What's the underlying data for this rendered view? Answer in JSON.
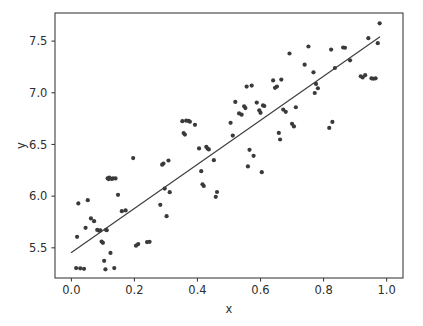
{
  "figure": {
    "width": 423,
    "height": 326,
    "background": "#ffffff"
  },
  "style": {
    "point_color": "#3a3a3a",
    "point_radius": 2.1,
    "line_color": "#3f3f3f",
    "line_width": 1.2,
    "axis_color": "#3f3f3f",
    "text_color": "#2e2e2e"
  },
  "axes_geometry": {
    "left_px": 55,
    "top_px": 13,
    "right_px": 403,
    "bottom_px": 278
  },
  "chart_data": {
    "type": "scatter",
    "title": "",
    "xlabel": "x",
    "ylabel": "y",
    "xlim": [
      -0.052,
      1.052
    ],
    "ylim": [
      5.208,
      7.772
    ],
    "xticks": [
      0.0,
      0.2,
      0.4,
      0.6,
      0.8,
      1.0
    ],
    "xticklabels": [
      "0.0",
      "0.2",
      "0.4",
      "0.6",
      "0.8",
      "1.0"
    ],
    "yticks": [
      5.5,
      6.0,
      6.5,
      7.0,
      7.5
    ],
    "yticklabels": [
      "5.5",
      "6.0",
      "6.5",
      "7.0",
      "7.5"
    ],
    "grid": false,
    "legend": null,
    "series": [
      {
        "name": "observations",
        "marker": "circle",
        "color": "#3a3a3a",
        "x": [
          0.015,
          0.018,
          0.022,
          0.028,
          0.04,
          0.045,
          0.052,
          0.062,
          0.072,
          0.082,
          0.088,
          0.092,
          0.096,
          0.1,
          0.104,
          0.108,
          0.11,
          0.112,
          0.115,
          0.118,
          0.12,
          0.124,
          0.128,
          0.132,
          0.136,
          0.14,
          0.148,
          0.16,
          0.172,
          0.196,
          0.205,
          0.212,
          0.24,
          0.248,
          0.282,
          0.288,
          0.292,
          0.296,
          0.302,
          0.308,
          0.312,
          0.352,
          0.356,
          0.36,
          0.364,
          0.372,
          0.376,
          0.392,
          0.405,
          0.412,
          0.416,
          0.42,
          0.428,
          0.432,
          0.436,
          0.452,
          0.458,
          0.462,
          0.505,
          0.512,
          0.52,
          0.532,
          0.54,
          0.548,
          0.552,
          0.556,
          0.56,
          0.565,
          0.572,
          0.578,
          0.588,
          0.596,
          0.6,
          0.604,
          0.608,
          0.612,
          0.64,
          0.646,
          0.652,
          0.658,
          0.662,
          0.666,
          0.672,
          0.68,
          0.692,
          0.7,
          0.706,
          0.712,
          0.74,
          0.752,
          0.768,
          0.772,
          0.776,
          0.782,
          0.818,
          0.824,
          0.828,
          0.836,
          0.862,
          0.868,
          0.884,
          0.918,
          0.924,
          0.932,
          0.942,
          0.952,
          0.958,
          0.965,
          0.972,
          0.978
        ],
        "y": [
          5.304,
          5.606,
          5.93,
          5.302,
          5.297,
          5.693,
          5.961,
          5.784,
          5.758,
          5.673,
          5.665,
          5.668,
          5.56,
          5.548,
          5.374,
          5.292,
          5.675,
          5.67,
          6.172,
          6.165,
          6.18,
          5.451,
          6.167,
          6.171,
          5.304,
          6.171,
          6.013,
          5.855,
          5.862,
          6.368,
          5.521,
          5.536,
          5.556,
          5.558,
          5.916,
          6.304,
          6.315,
          6.073,
          5.806,
          6.345,
          6.038,
          6.725,
          6.61,
          6.596,
          6.73,
          6.728,
          6.72,
          6.69,
          6.462,
          6.242,
          6.115,
          6.098,
          6.477,
          6.46,
          6.452,
          6.348,
          5.993,
          6.04,
          6.709,
          6.586,
          6.912,
          6.8,
          6.788,
          6.87,
          6.852,
          7.06,
          6.288,
          6.448,
          7.07,
          6.39,
          6.905,
          6.83,
          6.806,
          6.232,
          6.878,
          6.872,
          7.12,
          7.048,
          7.06,
          6.612,
          6.548,
          7.128,
          6.838,
          6.816,
          7.38,
          6.7,
          6.675,
          6.86,
          7.272,
          7.448,
          7.198,
          6.998,
          7.086,
          7.044,
          6.66,
          7.418,
          6.718,
          7.24,
          7.438,
          7.436,
          7.314,
          7.16,
          7.148,
          7.17,
          7.528,
          7.14,
          7.136,
          7.14,
          7.48,
          7.672
        ]
      }
    ],
    "fit_line": {
      "name": "least-squares fit",
      "color": "#3f3f3f",
      "x_start": 0.0,
      "x_end": 0.978,
      "y_start": 5.455,
      "y_end": 7.54,
      "slope": 2.132,
      "intercept": 5.455
    }
  }
}
